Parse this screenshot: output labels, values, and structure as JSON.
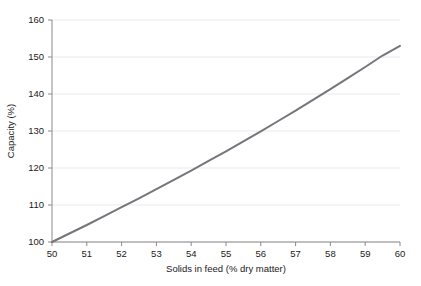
{
  "chart_data": {
    "type": "line",
    "title": "",
    "xlabel": "Solids in feed (% dry matter)",
    "ylabel": "Capacity (%)",
    "xlim": [
      50,
      60
    ],
    "ylim": [
      100,
      160
    ],
    "xticks": [
      50,
      51,
      52,
      53,
      54,
      55,
      56,
      57,
      58,
      59,
      60
    ],
    "yticks": [
      100,
      110,
      120,
      130,
      140,
      150,
      160
    ],
    "xtick_labels": [
      "50",
      "51",
      "52",
      "53",
      "54",
      "55",
      "56",
      "57",
      "58",
      "59",
      "60"
    ],
    "ytick_labels": [
      "100",
      "110",
      "120",
      "130",
      "140",
      "150",
      "160"
    ],
    "grid": "horizontal",
    "legend": "none",
    "series": [
      {
        "name": "Capacity vs solids in feed",
        "color": "#75757c",
        "line_width": 2,
        "x": [
          50,
          50.5,
          51,
          51.5,
          52,
          52.5,
          53,
          53.5,
          54,
          54.5,
          55,
          55.5,
          56,
          56.5,
          57,
          57.5,
          58,
          58.5,
          59,
          59.5,
          60
        ],
        "values": [
          100.0,
          102.3,
          104.6,
          107.0,
          109.4,
          111.8,
          114.3,
          116.8,
          119.3,
          121.9,
          124.5,
          127.2,
          129.9,
          132.7,
          135.5,
          138.4,
          141.3,
          144.3,
          147.3,
          150.4,
          153.0
        ]
      }
    ]
  },
  "axes": {
    "x_axis_name": "x-axis",
    "y_axis_name": "y-axis"
  },
  "colors": {
    "line": "#75757c",
    "gridline": "#e9e9eb",
    "axis": "#8a8a8a",
    "text": "#1a1a1a",
    "background": "#ffffff"
  }
}
